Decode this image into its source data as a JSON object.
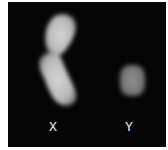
{
  "figure": {
    "background": "#050505",
    "chromosomes": [
      {
        "name": "X",
        "label": "X",
        "color": "#c8c8c8"
      },
      {
        "name": "Y",
        "label": "Y",
        "color": "#8a8a8a"
      }
    ]
  }
}
